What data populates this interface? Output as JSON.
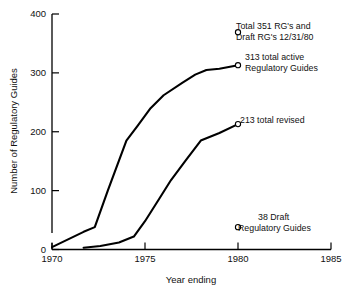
{
  "chart_data": {
    "type": "line",
    "title": "",
    "xlabel": "Year ending",
    "ylabel": "Number of Regulatory Guides",
    "xlim": [
      1970,
      1985
    ],
    "ylim": [
      0,
      400
    ],
    "xticks": [
      "1970",
      "1975",
      "1980",
      "1985"
    ],
    "xtick_values": [
      1970,
      1975,
      1980,
      1985
    ],
    "yticks": [
      "0",
      "100",
      "200",
      "300",
      "400"
    ],
    "ytick_values": [
      0,
      100,
      200,
      300,
      400
    ],
    "grid": false,
    "legend": "none",
    "axis_break_y": true,
    "series": [
      {
        "name": "313 total active Regulatory Guides",
        "marker_end": "open-circle",
        "x": [
          1970.0,
          1971.7,
          1972.3,
          1973.0,
          1974.0,
          1974.6,
          1975.3,
          1976.0,
          1977.0,
          1977.7,
          1978.3,
          1979.0,
          1980.0
        ],
        "y": [
          4,
          30,
          38,
          100,
          185,
          210,
          240,
          262,
          283,
          297,
          305,
          307,
          313
        ]
      },
      {
        "name": "213 total revised",
        "marker_end": "open-circle",
        "x": [
          1971.7,
          1972.6,
          1973.6,
          1974.4,
          1975.0,
          1975.8,
          1976.4,
          1977.2,
          1978.0,
          1979.0,
          1980.0
        ],
        "y": [
          3,
          6,
          12,
          22,
          48,
          88,
          118,
          152,
          185,
          198,
          213
        ]
      }
    ],
    "annotations": [
      {
        "id": "total-rgs",
        "marker": "open-circle",
        "lines": [
          "Total 351 RG's and",
          "Draft RG's 12/31/80"
        ],
        "marker_x": 1980,
        "marker_y": 369
      },
      {
        "id": "total-active",
        "marker": "curve-endpoint",
        "lines": [
          "313 total active",
          "Regulatory Guides"
        ],
        "marker_x": 1980,
        "marker_y": 313
      },
      {
        "id": "total-revised",
        "marker": "curve-endpoint",
        "lines": [
          "213 total revised"
        ],
        "marker_x": 1980,
        "marker_y": 213
      },
      {
        "id": "draft-rgs",
        "marker": "open-circle",
        "lines": [
          "38 Draft",
          "Regulatory Guides"
        ],
        "marker_x": 1980,
        "marker_y": 38
      }
    ],
    "colors": {
      "line": "#000000",
      "axis": "#000000",
      "text": "#111111",
      "background": "#ffffff"
    }
  }
}
